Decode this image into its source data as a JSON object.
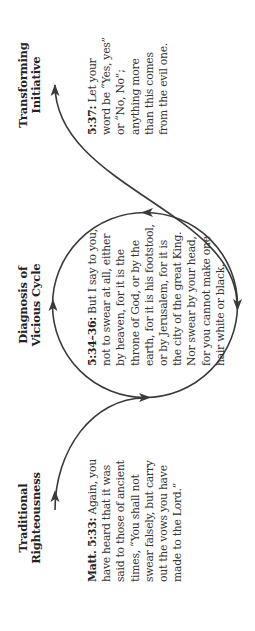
{
  "diagram": {
    "orientation": "rotated-90-ccw",
    "stroke_color": "#3a3a3a",
    "stages": [
      {
        "heading": [
          "Traditional",
          "Righteousness"
        ],
        "reference": "Matt. 5:33:",
        "text": "Again, you have heard that it was said to those of ancient times, “You shall not swear falsely, but carry out the vows you have made to the Lord.”"
      },
      {
        "heading": [
          "Diagnosis of",
          "Vicious Cycle"
        ],
        "reference": "5:34–36:",
        "text": "But I say to you, not to swear at all, either by heaven, for it is the throne of God, or by the earth, for it is his footstool, or by Jerusalem, for it is the city of the great King. Nor swear by your head, for you cannot make one hair white or black."
      },
      {
        "heading": [
          "Transforming",
          "Initiative"
        ],
        "reference": "5:37:",
        "text": "Let your word be “Yes, yes” or “No, No”; anything more than this comes from the evil one."
      }
    ]
  }
}
